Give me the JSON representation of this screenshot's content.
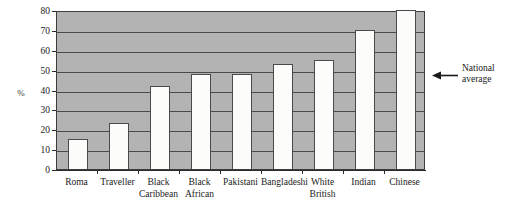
{
  "chart_data": {
    "type": "bar",
    "title": "",
    "xlabel": "",
    "ylabel": "%",
    "ylim": [
      0,
      80
    ],
    "ytick_step": 10,
    "yticks": [
      0,
      10,
      20,
      30,
      40,
      50,
      60,
      70,
      80
    ],
    "grid": true,
    "legend": false,
    "categories": [
      "Roma",
      "Traveller",
      "Black\nCaribbean",
      "Black\nAfrican",
      "Pakistani",
      "Bangladeshi",
      "White\nBritish",
      "Indian",
      "Chinese"
    ],
    "category_lines": [
      [
        "Roma"
      ],
      [
        "Traveller"
      ],
      [
        "Black",
        "Caribbean"
      ],
      [
        "Black",
        "African"
      ],
      [
        "Pakistani"
      ],
      [
        "Bangladeshi"
      ],
      [
        "White",
        "British"
      ],
      [
        "Indian"
      ],
      [
        "Chinese"
      ]
    ],
    "values": [
      15,
      23,
      42,
      48,
      48,
      53,
      55,
      70,
      80
    ],
    "annotations": [
      {
        "name": "national-average",
        "text": "National average",
        "lines": [
          "National",
          "average"
        ],
        "value": 50,
        "marker": "left-arrow"
      }
    ],
    "colors": {
      "plot_background": "#b3b3b3",
      "bar_fill": "#fcfcfa",
      "bar_stroke": "#4a4a4a",
      "gridline": "#4a4a4a",
      "axis": "#2a2a2a",
      "text": "#1a1a1a"
    }
  }
}
